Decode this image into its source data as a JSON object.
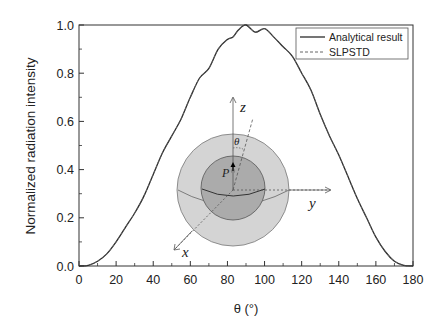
{
  "chart_data": {
    "type": "line",
    "title": "",
    "xlabel": "θ (°)",
    "ylabel": "Normalized radiation intensity",
    "xlim": [
      0,
      180
    ],
    "ylim": [
      0,
      1.0
    ],
    "xticks": [
      "0",
      "20",
      "40",
      "60",
      "80",
      "100",
      "120",
      "140",
      "160",
      "180"
    ],
    "yticks": [
      "0.0",
      "0.2",
      "0.4",
      "0.6",
      "0.8",
      "1.0"
    ],
    "grid": false,
    "legend_position": "top-right",
    "series": [
      {
        "name": "Analytical result",
        "style": "solid",
        "x": [
          0,
          5,
          10,
          15,
          20,
          25,
          30,
          35,
          40,
          45,
          50,
          55,
          60,
          65,
          70,
          75,
          80,
          83,
          86,
          90,
          95,
          100,
          105,
          110,
          115,
          120,
          125,
          130,
          135,
          140,
          145,
          150,
          155,
          160,
          165,
          170,
          175,
          180
        ],
        "values": [
          0,
          0.003,
          0.02,
          0.05,
          0.1,
          0.16,
          0.22,
          0.29,
          0.38,
          0.47,
          0.54,
          0.61,
          0.7,
          0.78,
          0.82,
          0.9,
          0.94,
          0.95,
          0.98,
          1.0,
          0.97,
          0.985,
          0.95,
          0.91,
          0.87,
          0.8,
          0.73,
          0.63,
          0.54,
          0.46,
          0.37,
          0.28,
          0.2,
          0.12,
          0.06,
          0.02,
          0.003,
          0
        ]
      },
      {
        "name": "SLPSTD",
        "style": "dashed",
        "x": [
          0,
          5,
          10,
          15,
          20,
          25,
          30,
          35,
          40,
          45,
          50,
          55,
          60,
          65,
          70,
          75,
          80,
          83,
          86,
          90,
          95,
          100,
          105,
          110,
          115,
          120,
          125,
          130,
          135,
          140,
          145,
          150,
          155,
          160,
          165,
          170,
          175,
          180
        ],
        "values": [
          0,
          0.003,
          0.02,
          0.05,
          0.1,
          0.16,
          0.22,
          0.29,
          0.38,
          0.47,
          0.54,
          0.61,
          0.7,
          0.78,
          0.82,
          0.9,
          0.94,
          0.95,
          0.98,
          1.0,
          0.97,
          0.985,
          0.95,
          0.91,
          0.87,
          0.8,
          0.73,
          0.63,
          0.54,
          0.46,
          0.37,
          0.28,
          0.2,
          0.12,
          0.06,
          0.02,
          0.003,
          0
        ]
      }
    ],
    "annotations": {
      "inset_diagram": "Two concentric spheres with axes x, y, z; point P with dipole arrow; angle θ from z-axis",
      "labels": [
        "z",
        "y",
        "x",
        "P",
        "θ"
      ]
    }
  },
  "legend": {
    "items": [
      {
        "label": "Analytical result"
      },
      {
        "label": "SLPSTD"
      }
    ]
  },
  "inset": {
    "z_label": "z",
    "y_label": "y",
    "x_label": "x",
    "p_label": "P",
    "theta_label": "θ"
  },
  "colors": {
    "line": "#2a2a2a",
    "outer_sphere": "#d4d4d4",
    "inner_sphere": "#ababab",
    "axis": "#333333"
  }
}
